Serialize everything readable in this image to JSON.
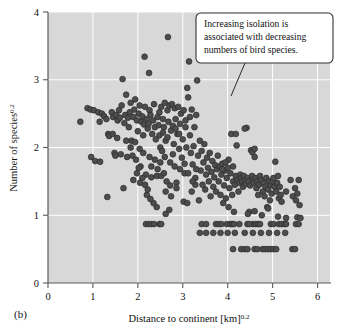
{
  "figure": {
    "panel_label": "(b)",
    "background_color": "#ffffff",
    "plot_background_color": "#d8d8d8",
    "gridline_color": "#ffffff",
    "axis_color": "#5a5a5a",
    "marker_fill": "#4d4d4d",
    "marker_stroke": "#2b2b2b"
  },
  "annotation": {
    "name": "callout-note",
    "lines": [
      "Increasing isolation is",
      "associated with decreasing",
      "numbers of bird species."
    ],
    "line1": "Increasing isolation is",
    "line2": "associated with decreasing",
    "line3": "numbers of bird species.",
    "box_fill": "#ffffff",
    "box_stroke": "#333333"
  },
  "chart_data": {
    "type": "scatter",
    "title": "",
    "xlabel": "Distance to continent [km]",
    "xlabel_exponent": "0.2",
    "ylabel": "Number of species",
    "ylabel_exponent": "0.2",
    "xlim": [
      0,
      6.3
    ],
    "ylim": [
      0,
      4
    ],
    "xticks": [
      0,
      1,
      2,
      3,
      4,
      5,
      6
    ],
    "yticks": [
      0,
      1,
      2,
      3,
      4
    ],
    "xtick_labels": [
      "0",
      "1",
      "2",
      "3",
      "4",
      "5",
      "6"
    ],
    "ytick_labels": [
      "0",
      "1",
      "2",
      "3",
      "4"
    ],
    "grid": true,
    "legend": "none",
    "annotations": [
      {
        "text": "Increasing isolation is associated with decreasing numbers of bird species.",
        "box_x": 3.25,
        "box_y": 3.75,
        "leader_from": [
          4.32,
          3.08
        ],
        "leader_to": [
          4.05,
          2.6
        ]
      }
    ],
    "points": [
      [
        0.72,
        2.38
      ],
      [
        0.88,
        2.58
      ],
      [
        0.95,
        2.56
      ],
      [
        0.96,
        1.86
      ],
      [
        1.02,
        2.55
      ],
      [
        1.05,
        1.8
      ],
      [
        1.12,
        2.52
      ],
      [
        1.15,
        2.38
      ],
      [
        1.16,
        1.79
      ],
      [
        1.2,
        2.5
      ],
      [
        1.25,
        2.46
      ],
      [
        1.3,
        2.42
      ],
      [
        1.32,
        1.27
      ],
      [
        1.34,
        2.2
      ],
      [
        1.36,
        2.17
      ],
      [
        1.42,
        2.52
      ],
      [
        1.45,
        2.45
      ],
      [
        1.48,
        1.92
      ],
      [
        1.5,
        1.88
      ],
      [
        1.52,
        2.48
      ],
      [
        1.55,
        2.4
      ],
      [
        1.58,
        2.55
      ],
      [
        1.6,
        2.44
      ],
      [
        1.62,
        1.9
      ],
      [
        1.64,
        2.62
      ],
      [
        1.66,
        3.01
      ],
      [
        1.68,
        1.4
      ],
      [
        1.7,
        2.36
      ],
      [
        1.72,
        2.48
      ],
      [
        1.74,
        2.78
      ],
      [
        1.76,
        1.86
      ],
      [
        1.78,
        2.44
      ],
      [
        1.8,
        2.3
      ],
      [
        1.82,
        2.52
      ],
      [
        1.84,
        2.66
      ],
      [
        1.86,
        2.1
      ],
      [
        1.88,
        1.88
      ],
      [
        1.9,
        2.45
      ],
      [
        1.92,
        2.56
      ],
      [
        1.94,
        2.71
      ],
      [
        1.96,
        1.82
      ],
      [
        1.98,
        2.4
      ],
      [
        2.0,
        2.24
      ],
      [
        2.02,
        2.5
      ],
      [
        2.04,
        2.62
      ],
      [
        2.06,
        1.72
      ],
      [
        2.08,
        2.38
      ],
      [
        2.1,
        2.46
      ],
      [
        2.12,
        2.18
      ],
      [
        2.14,
        2.34
      ],
      [
        2.15,
        3.34
      ],
      [
        2.16,
        2.6
      ],
      [
        2.18,
        1.6
      ],
      [
        2.2,
        2.42
      ],
      [
        2.22,
        2.28
      ],
      [
        2.24,
        2.35
      ],
      [
        2.25,
        3.1
      ],
      [
        2.26,
        2.55
      ],
      [
        2.28,
        2.48
      ],
      [
        2.3,
        1.56
      ],
      [
        2.32,
        2.2
      ],
      [
        2.34,
        2.4
      ],
      [
        2.36,
        2.64
      ],
      [
        2.38,
        2.3
      ],
      [
        2.4,
        2.12
      ],
      [
        2.42,
        1.58
      ],
      [
        2.44,
        2.45
      ],
      [
        2.46,
        2.33
      ],
      [
        2.48,
        2.52
      ],
      [
        2.5,
        2.0
      ],
      [
        2.52,
        2.6
      ],
      [
        2.54,
        1.95
      ],
      [
        2.56,
        2.42
      ],
      [
        2.58,
        2.3
      ],
      [
        2.6,
        2.66
      ],
      [
        2.62,
        2.1
      ],
      [
        2.64,
        1.5
      ],
      [
        2.66,
        2.55
      ],
      [
        2.67,
        3.63
      ],
      [
        2.68,
        2.38
      ],
      [
        2.7,
        2.62
      ],
      [
        2.72,
        1.44
      ],
      [
        2.74,
        2.25
      ],
      [
        2.76,
        2.64
      ],
      [
        2.78,
        1.9
      ],
      [
        2.8,
        2.05
      ],
      [
        2.82,
        2.58
      ],
      [
        2.84,
        2.42
      ],
      [
        2.86,
        1.48
      ],
      [
        2.88,
        2.2
      ],
      [
        2.9,
        2.6
      ],
      [
        2.92,
        1.98
      ],
      [
        2.94,
        2.35
      ],
      [
        2.96,
        2.5
      ],
      [
        2.98,
        1.85
      ],
      [
        3.0,
        2.12
      ],
      [
        3.02,
        2.55
      ],
      [
        3.04,
        1.62
      ],
      [
        3.06,
        2.3
      ],
      [
        3.08,
        2.0
      ],
      [
        3.1,
        2.88
      ],
      [
        3.12,
        2.74
      ],
      [
        3.14,
        3.27
      ],
      [
        3.16,
        2.18
      ],
      [
        3.18,
        1.92
      ],
      [
        3.2,
        2.56
      ],
      [
        3.22,
        1.75
      ],
      [
        3.24,
        2.02
      ],
      [
        3.26,
        2.3
      ],
      [
        3.28,
        1.55
      ],
      [
        3.3,
        2.48
      ],
      [
        3.32,
        2.99
      ],
      [
        3.34,
        1.88
      ],
      [
        3.36,
        1.22
      ],
      [
        3.38,
        2.1
      ],
      [
        3.4,
        1.66
      ],
      [
        3.42,
        1.95
      ],
      [
        3.44,
        1.45
      ],
      [
        3.46,
        1.78
      ],
      [
        3.48,
        2.05
      ],
      [
        3.5,
        1.38
      ],
      [
        3.52,
        1.6
      ],
      [
        3.54,
        1.85
      ],
      [
        3.56,
        1.7
      ],
      [
        3.58,
        1.5
      ],
      [
        3.6,
        1.92
      ],
      [
        3.62,
        1.28
      ],
      [
        3.64,
        1.64
      ],
      [
        3.66,
        1.8
      ],
      [
        3.68,
        1.42
      ],
      [
        3.7,
        1.56
      ],
      [
        3.72,
        1.74
      ],
      [
        3.74,
        1.35
      ],
      [
        3.76,
        1.68
      ],
      [
        3.78,
        1.88
      ],
      [
        3.8,
        1.5
      ],
      [
        3.82,
        1.72
      ],
      [
        3.84,
        1.3
      ],
      [
        3.86,
        1.6
      ],
      [
        3.88,
        1.76
      ],
      [
        3.9,
        1.18
      ],
      [
        3.92,
        1.44
      ],
      [
        3.94,
        1.66
      ],
      [
        3.96,
        1.25
      ],
      [
        3.98,
        1.55
      ],
      [
        4.0,
        1.7
      ],
      [
        4.02,
        1.12
      ],
      [
        4.04,
        1.4
      ],
      [
        4.06,
        1.62
      ],
      [
        4.08,
        2.2
      ],
      [
        4.1,
        1.3
      ],
      [
        4.12,
        1.5
      ],
      [
        4.14,
        1.05
      ],
      [
        4.16,
        1.45
      ],
      [
        4.18,
        1.58
      ],
      [
        4.2,
        2.03
      ],
      [
        4.22,
        1.52
      ],
      [
        4.24,
        1.35
      ],
      [
        4.26,
        1.48
      ],
      [
        4.28,
        1.6
      ],
      [
        4.3,
        1.55
      ],
      [
        4.32,
        1.5
      ],
      [
        4.34,
        1.42
      ],
      [
        4.36,
        1.58
      ],
      [
        4.38,
        1.52
      ],
      [
        4.4,
        1.46
      ],
      [
        4.42,
        2.29
      ],
      [
        4.44,
        1.55
      ],
      [
        4.46,
        1.5
      ],
      [
        4.48,
        1.05
      ],
      [
        4.5,
        1.44
      ],
      [
        4.52,
        1.96
      ],
      [
        4.54,
        1.58
      ],
      [
        4.56,
        1.52
      ],
      [
        4.58,
        1.48
      ],
      [
        4.6,
        1.86
      ],
      [
        4.62,
        1.55
      ],
      [
        4.64,
        1.4
      ],
      [
        4.66,
        1.5
      ],
      [
        4.68,
        1.3
      ],
      [
        4.7,
        1.45
      ],
      [
        4.72,
        1.58
      ],
      [
        4.74,
        1.52
      ],
      [
        4.76,
        1.0
      ],
      [
        4.78,
        1.35
      ],
      [
        4.8,
        1.48
      ],
      [
        4.82,
        1.28
      ],
      [
        4.84,
        1.42
      ],
      [
        4.86,
        1.55
      ],
      [
        4.88,
        1.12
      ],
      [
        4.9,
        1.38
      ],
      [
        4.92,
        1.5
      ],
      [
        4.94,
        1.22
      ],
      [
        4.96,
        1.45
      ],
      [
        4.98,
        1.32
      ],
      [
        5.0,
        1.5
      ],
      [
        5.02,
        1.55
      ],
      [
        5.04,
        1.42
      ],
      [
        5.06,
        1.79
      ],
      [
        5.08,
        1.35
      ],
      [
        5.1,
        1.48
      ],
      [
        5.12,
        1.58
      ],
      [
        5.14,
        1.25
      ],
      [
        5.16,
        1.42
      ],
      [
        5.18,
        1.3
      ],
      [
        5.2,
        1.2
      ],
      [
        5.3,
        1.35
      ],
      [
        5.4,
        1.52
      ],
      [
        5.45,
        1.28
      ],
      [
        5.5,
        1.4
      ],
      [
        5.52,
        1.22
      ],
      [
        5.55,
        1.32
      ],
      [
        5.58,
        1.52
      ],
      [
        5.6,
        1.15
      ],
      [
        4.18,
        2.2
      ],
      [
        4.38,
        2.28
      ],
      [
        4.55,
        1.93
      ],
      [
        4.6,
        1.98
      ],
      [
        4.02,
        1.82
      ],
      [
        3.95,
        1.78
      ],
      [
        4.12,
        1.72
      ],
      [
        3.88,
        1.68
      ],
      [
        4.45,
        1.02
      ],
      [
        4.6,
        1.06
      ],
      [
        4.9,
        1.1
      ],
      [
        5.12,
        0.98
      ],
      [
        5.3,
        0.96
      ],
      [
        5.55,
        0.97
      ],
      [
        5.62,
        0.96
      ],
      [
        2.18,
        0.87
      ],
      [
        2.24,
        0.87
      ],
      [
        2.3,
        0.87
      ],
      [
        2.36,
        0.87
      ],
      [
        2.48,
        0.87
      ],
      [
        2.52,
        0.87
      ],
      [
        3.42,
        0.87
      ],
      [
        3.52,
        0.87
      ],
      [
        3.74,
        0.87
      ],
      [
        3.8,
        0.87
      ],
      [
        3.86,
        0.87
      ],
      [
        3.98,
        0.87
      ],
      [
        4.06,
        0.87
      ],
      [
        4.1,
        0.87
      ],
      [
        4.14,
        0.87
      ],
      [
        4.26,
        0.87
      ],
      [
        4.56,
        0.87
      ],
      [
        4.62,
        0.87
      ],
      [
        4.68,
        0.87
      ],
      [
        4.72,
        0.87
      ],
      [
        4.96,
        0.87
      ],
      [
        5.02,
        0.87
      ],
      [
        5.14,
        0.87
      ],
      [
        5.2,
        0.87
      ],
      [
        5.26,
        0.87
      ],
      [
        5.3,
        0.87
      ],
      [
        5.52,
        0.87
      ],
      [
        5.58,
        0.87
      ],
      [
        4.44,
        0.87
      ],
      [
        4.48,
        0.87
      ],
      [
        3.38,
        0.74
      ],
      [
        3.52,
        0.74
      ],
      [
        3.68,
        0.74
      ],
      [
        3.84,
        0.74
      ],
      [
        4.0,
        0.74
      ],
      [
        4.16,
        0.74
      ],
      [
        4.38,
        0.74
      ],
      [
        4.56,
        0.74
      ],
      [
        4.74,
        0.74
      ],
      [
        4.92,
        0.74
      ],
      [
        5.1,
        0.74
      ],
      [
        5.28,
        0.74
      ],
      [
        4.12,
        0.5
      ],
      [
        4.3,
        0.5
      ],
      [
        4.38,
        0.5
      ],
      [
        4.44,
        0.5
      ],
      [
        4.6,
        0.5
      ],
      [
        4.66,
        0.5
      ],
      [
        4.78,
        0.5
      ],
      [
        4.84,
        0.5
      ],
      [
        4.9,
        0.5
      ],
      [
        4.96,
        0.5
      ],
      [
        5.02,
        0.5
      ],
      [
        5.08,
        0.5
      ],
      [
        5.44,
        0.5
      ],
      [
        5.5,
        0.5
      ],
      [
        2.62,
        1.02
      ],
      [
        2.7,
        1.08
      ],
      [
        3.02,
        1.2
      ],
      [
        3.1,
        1.18
      ],
      [
        2.35,
        1.18
      ],
      [
        2.42,
        1.12
      ],
      [
        2.2,
        1.3
      ],
      [
        2.28,
        1.24
      ],
      [
        1.9,
        1.52
      ],
      [
        2.05,
        1.48
      ],
      [
        2.1,
        1.55
      ],
      [
        2.52,
        1.58
      ],
      [
        2.58,
        1.62
      ],
      [
        2.44,
        1.68
      ],
      [
        2.3,
        1.72
      ],
      [
        1.98,
        1.62
      ],
      [
        2.02,
        1.7
      ],
      [
        2.16,
        1.45
      ],
      [
        2.22,
        1.38
      ],
      [
        2.62,
        1.35
      ],
      [
        2.74,
        1.28
      ],
      [
        2.86,
        1.4
      ],
      [
        3.2,
        1.35
      ],
      [
        3.28,
        1.45
      ],
      [
        2.48,
        2.18
      ],
      [
        2.56,
        2.22
      ],
      [
        2.66,
        2.15
      ],
      [
        2.78,
        2.32
      ],
      [
        2.84,
        2.28
      ],
      [
        2.92,
        2.2
      ],
      [
        3.06,
        2.4
      ],
      [
        3.16,
        2.45
      ],
      [
        1.44,
        2.2
      ],
      [
        1.54,
        2.14
      ],
      [
        1.74,
        2.1
      ],
      [
        1.84,
        2.0
      ],
      [
        1.94,
        2.08
      ],
      [
        2.04,
        1.98
      ],
      [
        2.12,
        1.92
      ],
      [
        2.26,
        1.86
      ],
      [
        2.38,
        1.82
      ],
      [
        2.5,
        1.78
      ],
      [
        2.6,
        1.86
      ],
      [
        2.72,
        1.78
      ],
      [
        2.82,
        1.72
      ],
      [
        2.94,
        1.68
      ],
      [
        3.04,
        1.76
      ],
      [
        3.12,
        1.62
      ],
      [
        3.22,
        1.5
      ],
      [
        3.3,
        1.68
      ]
    ]
  }
}
